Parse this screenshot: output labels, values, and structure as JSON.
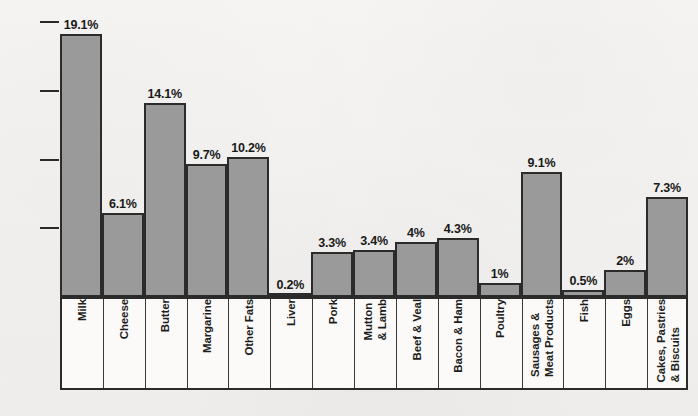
{
  "chart_data": {
    "type": "bar",
    "title": "",
    "subtitle": "",
    "xlabel": "",
    "ylabel": "",
    "ylim": [
      0,
      20
    ],
    "grid": false,
    "legend": null,
    "orientation": "vertical",
    "value_label_suffix": "%",
    "y_ticks": [
      {
        "value": 20,
        "label": "20%"
      },
      {
        "value": 15,
        "label": "15%"
      },
      {
        "value": 10,
        "label": "10%"
      },
      {
        "value": 5,
        "label": "5%"
      }
    ],
    "categories": [
      "Milk",
      "Cheese",
      "Butter",
      "Margarine",
      "Other Fats",
      "Liver",
      "Pork",
      "Mutton\n& Lamb",
      "Beef & Veal",
      "Bacon & Ham",
      "Poultry",
      "Sausages &\nMeat Products",
      "Fish",
      "Eggs",
      "Cakes, Pastries\n& Biscuits"
    ],
    "values": [
      19.1,
      6.1,
      14.1,
      9.7,
      10.2,
      0.2,
      3.3,
      3.4,
      4,
      4.3,
      1,
      9.1,
      0.5,
      2,
      7.3
    ],
    "value_labels": [
      "19.1%",
      "6.1%",
      "14.1%",
      "9.7%",
      "10.2%",
      "0.2%",
      "3.3%",
      "3.4%",
      "4%",
      "4.3%",
      "1%",
      "9.1%",
      "0.5%",
      "2%",
      "7.3%"
    ]
  },
  "style": {
    "bar_fill": "#9a9a9a",
    "bar_stroke": "#2b2b2b",
    "background": "#f4f3f1",
    "label_box_fill": "#fbfaf8",
    "text_color": "#1b1b1b"
  }
}
